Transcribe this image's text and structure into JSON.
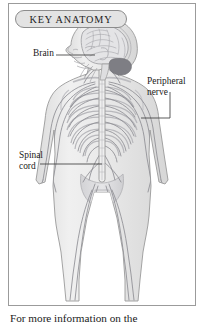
{
  "panel": {
    "header_title": "KEY ANATOMY",
    "caption": "For more information on the"
  },
  "callouts": [
    {
      "name": "brain",
      "label": "Brain"
    },
    {
      "name": "peripheral-nerve",
      "label": "Peripheral\nnerve"
    },
    {
      "name": "spinal-cord",
      "label": "Spinal\ncord"
    }
  ],
  "figure": {
    "alt": "anterior view of human body showing nervous system",
    "icon": "human-nervous-system-illustration"
  },
  "colors": {
    "page_background": "#ffffff",
    "panel_border": "#9b9b9b",
    "header_fill": "#e3e3e3",
    "header_border": "#8c8c8c",
    "text": "#1a1a1a",
    "body_fill": "#ebebeb",
    "body_outline": "#9a9a9a",
    "nerve": "#8e8e94",
    "bone": "#c9c9cc",
    "leader_line": "#4a4a4a"
  }
}
